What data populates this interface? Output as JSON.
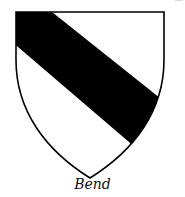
{
  "figure": {
    "caption": "Bend",
    "charge": "bend",
    "colors": {
      "field": "#ffffff",
      "charge": "#000000",
      "outline": "#000000"
    }
  }
}
